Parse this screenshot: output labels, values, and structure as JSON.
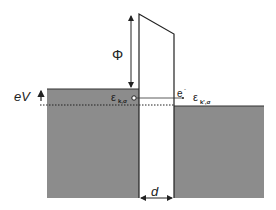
{
  "diagram": {
    "labels": {
      "phi": "Φ",
      "ev": "eV",
      "eps_left": "ε",
      "eps_left_sub": "k,σ",
      "electron": "e",
      "electron_sup": "-",
      "eps_right": "ε",
      "eps_right_sub": "k',σ",
      "d": "d"
    },
    "colors": {
      "metal_fill": "#8c8c8c",
      "line": "#222222",
      "background": "#ffffff"
    }
  }
}
